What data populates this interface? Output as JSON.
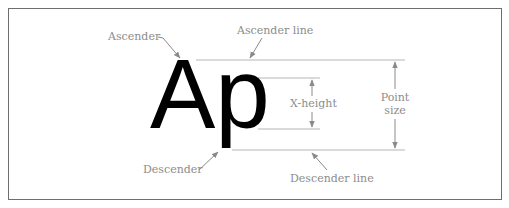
{
  "diagram": {
    "sample_text": "Ap",
    "labels": {
      "ascender": "Ascender",
      "ascender_line": "Ascender line",
      "x_height": "X-height",
      "point_size_line1": "Point",
      "point_size_line2": "size",
      "descender": "Descender",
      "descender_line": "Descender line"
    },
    "colors": {
      "frame": "#6e6e6e",
      "guides": "#b5b5b5",
      "labels": "#8c8c8c",
      "arrows": "#8a8a8a",
      "glyph": "#000000",
      "background": "#ffffff"
    }
  }
}
